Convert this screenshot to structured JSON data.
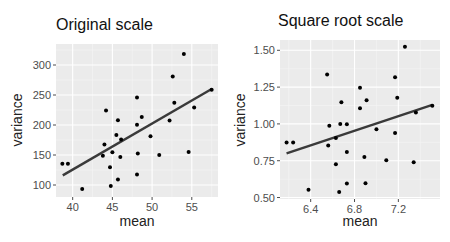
{
  "chart_data": [
    {
      "type": "scatter",
      "title": "Original scale",
      "xlabel": "mean",
      "ylabel": "variance",
      "xlim": [
        37.9,
        58.3
      ],
      "ylim": [
        80,
        335
      ],
      "xticks": [
        40,
        45,
        50,
        55
      ],
      "yticks": [
        100,
        150,
        200,
        250,
        300
      ],
      "xtick_labels": [
        "40",
        "45",
        "50",
        "55"
      ],
      "ytick_labels": [
        "100",
        "150",
        "200",
        "250",
        "300"
      ],
      "grid": true,
      "legend": null,
      "points": [
        [
          38.7,
          135.5
        ],
        [
          39.4,
          135.5
        ],
        [
          41.2,
          93.5
        ],
        [
          44.2,
          224
        ],
        [
          45.7,
          208
        ],
        [
          48.7,
          213.4
        ],
        [
          48.1,
          200.5
        ],
        [
          48.1,
          245.7
        ],
        [
          45.5,
          183.4
        ],
        [
          46.1,
          175.8
        ],
        [
          49.8,
          181.1
        ],
        [
          44.0,
          167.3
        ],
        [
          43.8,
          148.9
        ],
        [
          45.0,
          154.4
        ],
        [
          46.0,
          146.8
        ],
        [
          48.2,
          152.7
        ],
        [
          50.9,
          150.0
        ],
        [
          44.7,
          129.5
        ],
        [
          45.7,
          109.2
        ],
        [
          48.1,
          117.7
        ],
        [
          44.8,
          98.4
        ],
        [
          54.0,
          318.2
        ],
        [
          52.6,
          280.7
        ],
        [
          57.5,
          258.6
        ],
        [
          52.8,
          237.1
        ],
        [
          55.3,
          229.0
        ],
        [
          52.2,
          207.6
        ],
        [
          54.6,
          154.8
        ]
      ],
      "fit_line": [
        [
          38.75,
          116
        ],
        [
          57.5,
          260
        ]
      ]
    },
    {
      "type": "scatter",
      "title": "Square root scale",
      "xlabel": "mean",
      "ylabel": "variance",
      "xlim": [
        6.12,
        7.58
      ],
      "ylim": [
        0.49,
        1.57
      ],
      "xticks": [
        6.4,
        6.8,
        7.2
      ],
      "yticks": [
        0.5,
        0.75,
        1.0,
        1.25,
        1.5
      ],
      "xtick_labels": [
        "6.4",
        "6.8",
        "7.2"
      ],
      "ytick_labels": [
        "0.50",
        "0.75",
        "1.00",
        "1.25",
        "1.50"
      ],
      "grid": true,
      "legend": null,
      "points": [
        [
          6.18,
          0.874
        ],
        [
          6.24,
          0.874
        ],
        [
          6.55,
          1.336
        ],
        [
          6.68,
          1.148
        ],
        [
          6.85,
          1.246
        ],
        [
          6.85,
          1.107
        ],
        [
          6.57,
          0.987
        ],
        [
          6.67,
          0.999
        ],
        [
          6.73,
          0.997
        ],
        [
          6.63,
          0.905
        ],
        [
          6.56,
          0.853
        ],
        [
          6.73,
          0.809
        ],
        [
          6.63,
          0.726
        ],
        [
          6.73,
          0.595
        ],
        [
          6.38,
          0.552
        ],
        [
          6.66,
          0.538
        ],
        [
          7.26,
          1.524
        ],
        [
          7.17,
          1.317
        ],
        [
          6.91,
          1.16
        ],
        [
          7.19,
          1.178
        ],
        [
          7.51,
          1.124
        ],
        [
          7.36,
          1.077
        ],
        [
          7.0,
          0.964
        ],
        [
          7.17,
          0.938
        ],
        [
          6.89,
          0.775
        ],
        [
          7.09,
          0.754
        ],
        [
          7.34,
          0.74
        ],
        [
          6.9,
          0.597
        ]
      ],
      "fit_line": [
        [
          6.18,
          0.8
        ],
        [
          7.51,
          1.13
        ]
      ]
    }
  ],
  "style": {
    "panel_bg": "#ebebeb",
    "grid_major": "#ffffff",
    "grid_minor": "#f5f5f5",
    "point_color": "#000000",
    "line_color": "#3a3a3a",
    "tick_color": "#4d4d4d"
  },
  "layout": [
    {
      "panel": {
        "left": 56,
        "top": 44,
        "right": 218,
        "bottom": 197
      },
      "title_pos": {
        "left": 56,
        "top": 16
      },
      "ylabel_center": {
        "x": 17,
        "y": 120
      },
      "xlabel_center": {
        "x": 137,
        "y": 222
      }
    },
    {
      "panel": {
        "left": 280,
        "top": 40,
        "right": 440,
        "bottom": 199
      },
      "title_pos": {
        "left": 278,
        "top": 12
      },
      "ylabel_center": {
        "x": 240,
        "y": 120
      },
      "xlabel_center": {
        "x": 360,
        "y": 222
      }
    }
  ]
}
